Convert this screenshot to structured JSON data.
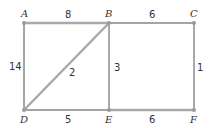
{
  "graph": {
    "title": "",
    "colors": {
      "tree_edge": "#a9a9a9",
      "other_edge": "#4a4a4a",
      "node": "#9a9a9a",
      "text": "#333333"
    },
    "nodes": [
      {
        "id": "A",
        "x": 24,
        "y": 23
      },
      {
        "id": "B",
        "x": 109,
        "y": 23
      },
      {
        "id": "C",
        "x": 194,
        "y": 23
      },
      {
        "id": "D",
        "x": 24,
        "y": 110
      },
      {
        "id": "E",
        "x": 109,
        "y": 110
      },
      {
        "id": "F",
        "x": 194,
        "y": 110
      }
    ],
    "edges": [
      {
        "from": "A",
        "to": "B",
        "weight": "8",
        "in_tree": true
      },
      {
        "from": "B",
        "to": "C",
        "weight": "6",
        "in_tree": false
      },
      {
        "from": "A",
        "to": "D",
        "weight": "14",
        "in_tree": false
      },
      {
        "from": "B",
        "to": "D",
        "weight": "2",
        "in_tree": true
      },
      {
        "from": "B",
        "to": "E",
        "weight": "3",
        "in_tree": true
      },
      {
        "from": "C",
        "to": "F",
        "weight": "1",
        "in_tree": true
      },
      {
        "from": "D",
        "to": "E",
        "weight": "5",
        "in_tree": false
      },
      {
        "from": "E",
        "to": "F",
        "weight": "6",
        "in_tree": true
      }
    ]
  }
}
